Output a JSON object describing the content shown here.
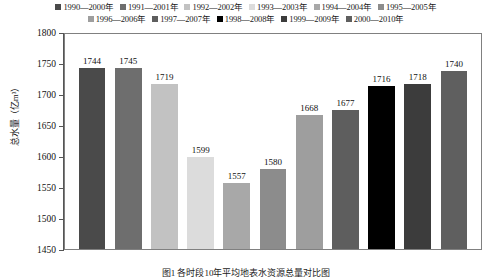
{
  "chart_data": {
    "type": "bar",
    "title": "",
    "xlabel": "",
    "ylabel": "总水量（亿m³）",
    "ylim": [
      1450,
      1800
    ],
    "ytick_step": 50,
    "yticks": [
      "1800",
      "1750",
      "1700",
      "1650",
      "1600",
      "1550",
      "1500",
      "1450"
    ],
    "grid": false,
    "legend_position": "top",
    "categories": [
      "1990—2000年",
      "1991—2001年",
      "1992—2002年",
      "1993—2003年",
      "1994—2004年",
      "1995—2005年",
      "1996—2006年",
      "1997—2007年",
      "1998—2008年",
      "1999—2009年",
      "2000—2010年"
    ],
    "values": [
      1744,
      1745,
      1719,
      1599,
      1557,
      1580,
      1668,
      1677,
      1716,
      1718,
      1740
    ],
    "colors": [
      "#4a4a4a",
      "#6e6e6e",
      "#c2c2c2",
      "#dcdcdc",
      "#a8a8a8",
      "#8c8c8c",
      "#9e9e9e",
      "#5e5e5e",
      "#000000",
      "#3c3c3c",
      "#5f5f5f"
    ],
    "data_labels": [
      "1744",
      "1745",
      "1719",
      "1599",
      "1557",
      "1580",
      "1668",
      "1677",
      "1716",
      "1718",
      "1740"
    ]
  },
  "legend": {
    "row1": [
      {
        "label": "1990—2000年",
        "color": "#4a4a4a"
      },
      {
        "label": "1991—2001年",
        "color": "#6e6e6e"
      },
      {
        "label": "1992—2002年",
        "color": "#c2c2c2"
      },
      {
        "label": "1993—2003年",
        "color": "#dcdcdc"
      },
      {
        "label": "1994—2004年",
        "color": "#a8a8a8"
      },
      {
        "label": "1995—2005年",
        "color": "#8c8c8c"
      }
    ],
    "row2": [
      {
        "label": "1996—2006年",
        "color": "#9e9e9e"
      },
      {
        "label": "1997—2007年",
        "color": "#5e5e5e"
      },
      {
        "label": "1998—2008年",
        "color": "#000000"
      },
      {
        "label": "1999—2009年",
        "color": "#3c3c3c"
      },
      {
        "label": "2000—2010年",
        "color": "#5f5f5f"
      }
    ]
  },
  "axis": {
    "y_title": "总水量（亿m³）"
  },
  "caption": "图1  各时段10年平均地表水资源总量对比图"
}
